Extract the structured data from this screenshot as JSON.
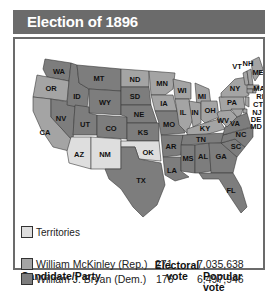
{
  "title": "Election of 1896",
  "colors": {
    "header_bg": "#6b6b6b",
    "republican": "#a4a4a4",
    "democrat": "#7d7d7d",
    "territory": "#dedede"
  },
  "legend": {
    "territories_label": "Territories"
  },
  "table": {
    "headers": {
      "candidate": "Candidate/Party",
      "electoral_line1": "Electoral",
      "electoral_line2": "vote",
      "popular": "Popular vote"
    },
    "rows": [
      {
        "candidate": "William McKinley (Rep.)",
        "party": "republican",
        "electoral": "271",
        "popular": "7,035,638"
      },
      {
        "candidate": "William J. Bryan (Dem.)",
        "party": "democrat",
        "electoral": "176",
        "popular": "6,497,946"
      }
    ]
  },
  "states": {
    "WA": "WA",
    "OR": "OR",
    "CA": "CA",
    "NV": "NV",
    "ID": "ID",
    "MT": "MT",
    "WY": "WY",
    "UT": "UT",
    "CO": "CO",
    "AZ": "AZ",
    "NM": "NM",
    "ND": "ND",
    "SD": "SD",
    "NE": "NE",
    "KS": "KS",
    "OK": "OK",
    "TX": "TX",
    "MN": "MN",
    "IA": "IA",
    "MO": "MO",
    "AR": "AR",
    "LA": "LA",
    "WI": "WI",
    "IL": "IL",
    "MI": "MI",
    "IN": "IN",
    "OH": "OH",
    "KY": "KY",
    "TN": "TN",
    "MS": "MS",
    "AL": "AL",
    "GA": "GA",
    "FL": "FL",
    "SC": "SC",
    "NC": "NC",
    "VA": "VA",
    "WV": "WV",
    "PA": "PA",
    "NY": "NY",
    "VT": "VT",
    "NH": "NH",
    "ME": "ME",
    "MA": "MA",
    "RI": "RI",
    "CT": "CT",
    "NJ": "NJ",
    "DE": "DE",
    "MD": "MD"
  }
}
